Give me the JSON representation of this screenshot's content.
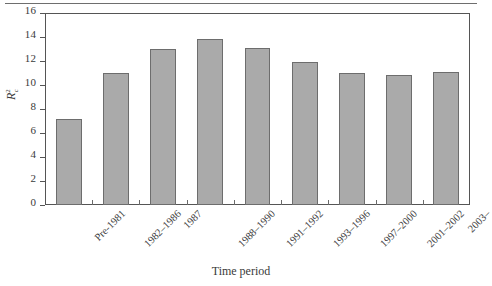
{
  "chart_data": {
    "type": "bar",
    "title": "",
    "xlabel": "Time period",
    "ylabel": "R²c",
    "ylabel_base": "R",
    "ylabel_sup": "2",
    "ylabel_sub": "c",
    "categories": [
      "Pre-1981",
      "1982–1986",
      "1987",
      "1988–1990",
      "1991–1992",
      "1993–1996",
      "1997–2000",
      "2001–2002",
      "2003–"
    ],
    "values": [
      7.2,
      11.0,
      13.0,
      13.8,
      13.1,
      11.9,
      11.0,
      10.8,
      11.1
    ],
    "ylim": [
      0,
      16
    ],
    "yticks": [
      0,
      2,
      4,
      6,
      8,
      10,
      12,
      14,
      16
    ],
    "ytick_labels": [
      "0",
      "2",
      "4",
      "6",
      "8",
      "10",
      "12",
      "14",
      "16"
    ],
    "grid": false,
    "legend": null,
    "bar_color": "#aaaaaa",
    "bar_edge_color": "#6d6d6d",
    "frame_color": "#555555",
    "text_color": "#3a3a3a"
  }
}
